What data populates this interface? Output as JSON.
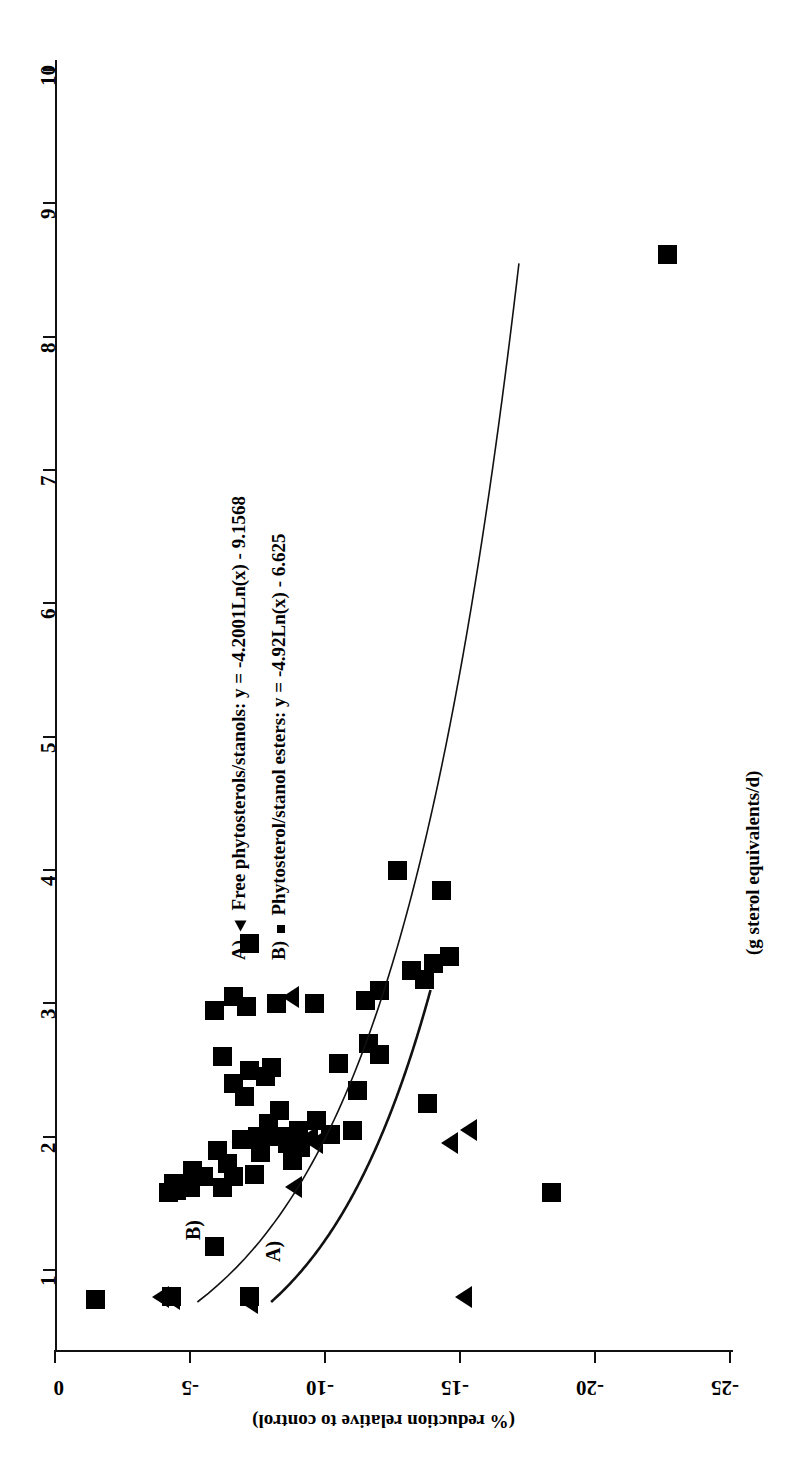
{
  "chart_data": {
    "type": "scatter",
    "title": "",
    "orientation": "rotated-90",
    "xlabel": "(g sterol equivalents/d)",
    "ylabel": "(% reduction relative to control)",
    "xlim": [
      0,
      10
    ],
    "ylim": [
      -25,
      0
    ],
    "x_ticks": [
      1,
      2,
      3,
      4,
      5,
      6,
      7,
      8,
      9,
      10
    ],
    "y_ticks": [
      0,
      -5,
      -10,
      -15,
      -20,
      -25
    ],
    "grid": false,
    "legend_position": "upper-middle",
    "series": [
      {
        "name": "A) Free phytosterols/stanols",
        "key": "triangle",
        "label": "A)  Free phytosterols/stanols: y = -4.2001Ln(x) - 9.1568",
        "fit_equation": "y = -4.2001Ln(x) - 9.1568",
        "fit_coefficients": {
          "a": -4.2001,
          "b": -9.1568
        },
        "points": [
          {
            "x": 0.75,
            "y": -7.2
          },
          {
            "x": 0.78,
            "y": -4.3
          },
          {
            "x": 0.8,
            "y": -3.9
          },
          {
            "x": 0.8,
            "y": -15.1
          },
          {
            "x": 1.62,
            "y": -8.8
          },
          {
            "x": 1.95,
            "y": -9.6
          },
          {
            "x": 1.95,
            "y": -14.6
          },
          {
            "x": 2.0,
            "y": -9.4
          },
          {
            "x": 2.05,
            "y": -15.3
          },
          {
            "x": 3.05,
            "y": -8.7
          }
        ]
      },
      {
        "name": "B) Phytosterol/stanol esters",
        "key": "square",
        "label": "B)  Phytosterol/stanol esters: y = -4.92Ln(x) - 6.625",
        "fit_equation": "y = -4.92Ln(x) - 6.625",
        "fit_coefficients": {
          "a": -4.92,
          "b": -6.625
        },
        "points": [
          {
            "x": 0.78,
            "y": -1.5
          },
          {
            "x": 0.8,
            "y": -4.3
          },
          {
            "x": 0.8,
            "y": -7.2
          },
          {
            "x": 1.18,
            "y": -5.9
          },
          {
            "x": 1.58,
            "y": -4.2
          },
          {
            "x": 1.6,
            "y": -4.5
          },
          {
            "x": 1.62,
            "y": -5.0
          },
          {
            "x": 1.62,
            "y": -6.2
          },
          {
            "x": 1.65,
            "y": -4.4
          },
          {
            "x": 1.7,
            "y": -5.5
          },
          {
            "x": 1.7,
            "y": -6.6
          },
          {
            "x": 1.72,
            "y": -7.4
          },
          {
            "x": 1.75,
            "y": -5.1
          },
          {
            "x": 1.8,
            "y": -6.4
          },
          {
            "x": 1.82,
            "y": -8.8
          },
          {
            "x": 1.88,
            "y": -7.6
          },
          {
            "x": 1.9,
            "y": -6.0
          },
          {
            "x": 1.92,
            "y": -9.1
          },
          {
            "x": 1.95,
            "y": -8.6
          },
          {
            "x": 1.98,
            "y": -6.9
          },
          {
            "x": 2.0,
            "y": -7.5
          },
          {
            "x": 2.0,
            "y": -8.2
          },
          {
            "x": 2.0,
            "y": -8.9
          },
          {
            "x": 2.02,
            "y": -10.2
          },
          {
            "x": 2.05,
            "y": -9.0
          },
          {
            "x": 2.05,
            "y": -11.0
          },
          {
            "x": 2.1,
            "y": -7.9
          },
          {
            "x": 2.12,
            "y": -9.7
          },
          {
            "x": 2.2,
            "y": -8.3
          },
          {
            "x": 2.25,
            "y": -13.8
          },
          {
            "x": 2.3,
            "y": -7.0
          },
          {
            "x": 2.35,
            "y": -11.2
          },
          {
            "x": 2.4,
            "y": -6.6
          },
          {
            "x": 2.45,
            "y": -7.8
          },
          {
            "x": 2.5,
            "y": -7.2
          },
          {
            "x": 2.52,
            "y": -8.0
          },
          {
            "x": 2.55,
            "y": -10.5
          },
          {
            "x": 2.6,
            "y": -6.2
          },
          {
            "x": 2.62,
            "y": -12.0
          },
          {
            "x": 2.7,
            "y": -11.6
          },
          {
            "x": 2.95,
            "y": -5.9
          },
          {
            "x": 2.98,
            "y": -7.1
          },
          {
            "x": 3.0,
            "y": -8.2
          },
          {
            "x": 3.0,
            "y": -9.6
          },
          {
            "x": 3.02,
            "y": -11.5
          },
          {
            "x": 3.05,
            "y": -6.6
          },
          {
            "x": 3.1,
            "y": -12.0
          },
          {
            "x": 3.18,
            "y": -13.7
          },
          {
            "x": 3.25,
            "y": -13.2
          },
          {
            "x": 3.3,
            "y": -14.0
          },
          {
            "x": 3.35,
            "y": -14.6
          },
          {
            "x": 3.45,
            "y": -7.2
          },
          {
            "x": 3.85,
            "y": -14.3
          },
          {
            "x": 4.0,
            "y": -12.7
          },
          {
            "x": 1.58,
            "y": -18.4
          },
          {
            "x": 8.62,
            "y": -22.7
          }
        ]
      }
    ]
  },
  "axes": {
    "x_tick_labels": [
      "1",
      "2",
      "3",
      "4",
      "5",
      "6",
      "7",
      "8",
      "9",
      "10"
    ],
    "y_tick_labels": [
      "0",
      "-5",
      "-10",
      "-15",
      "-20",
      "-25"
    ],
    "x_title": "(g sterol equivalents/d)",
    "y_title": "(% reduction relative to control)"
  },
  "legend": {
    "entries": [
      {
        "tag": "A)",
        "marker": "triangle",
        "text": "Free phytosterols/stanols: y = -4.2001Ln(x) - 9.1568"
      },
      {
        "tag": "B)",
        "marker": "square",
        "text": "Phytosterol/stanol esters: y = -4.92Ln(x) - 6.625"
      }
    ]
  },
  "curve_tags": {
    "a": "A)",
    "b": "B)"
  },
  "colors": {
    "ink": "#000000",
    "background": "#ffffff"
  }
}
